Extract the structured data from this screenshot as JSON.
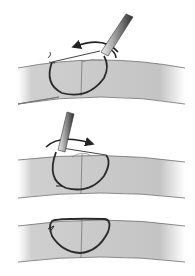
{
  "figure": {
    "panels": [
      {
        "id": "panel-1",
        "step": "Needle passes through tissue, thread pulled in arc direction"
      },
      {
        "id": "panel-2",
        "step": "Needle holder rotates, thread loop formed"
      },
      {
        "id": "panel-3",
        "step": "Completed stitch loop"
      }
    ],
    "colors": {
      "background": "#ffffff",
      "tissue_fill": "#c8c8c8",
      "tissue_edge": "#6e6e6e",
      "thread": "#2a2a2a",
      "instrument_light": "#e0e0e0",
      "instrument_dark": "#3a3a3a",
      "incision": "#777777"
    }
  }
}
